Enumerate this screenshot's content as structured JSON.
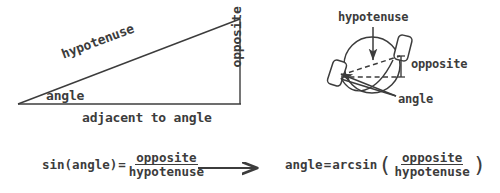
{
  "figure": {
    "ink_color": "#3c3c3c",
    "background_color": "#ffffff"
  },
  "triangle_diagram": {
    "name": "right-triangle",
    "labels": {
      "hypotenuse": "hypotenuse",
      "angle": "angle",
      "adjacent": "adjacent to angle",
      "opposite": "opposite to angle"
    },
    "geometry": {
      "left_vertex": [
        18,
        104
      ],
      "right_bottom_vertex": [
        240,
        104
      ],
      "right_top_vertex": [
        240,
        19
      ]
    }
  },
  "crank_diagram": {
    "name": "bicycle-crank",
    "labels": {
      "hypotenuse": "hypotenuse",
      "opposite": "opposite",
      "angle": "angle"
    },
    "geometry": {
      "circle_center": [
        372,
        65
      ],
      "circle_radius": 28,
      "left_pedal": [
        337,
        73
      ],
      "right_pedal": [
        403,
        48
      ]
    }
  },
  "formulas": {
    "sine": {
      "lhs": "sin(angle)",
      "equals": "=",
      "numerator": "opposite",
      "denominator": "hypotenuse"
    },
    "arrow": "⟶",
    "arcsine": {
      "lhs": "angle",
      "equals": "=",
      "function": "arcsin",
      "open_paren": "(",
      "numerator": "opposite",
      "denominator": "hypotenuse",
      "close_paren": ")"
    }
  }
}
